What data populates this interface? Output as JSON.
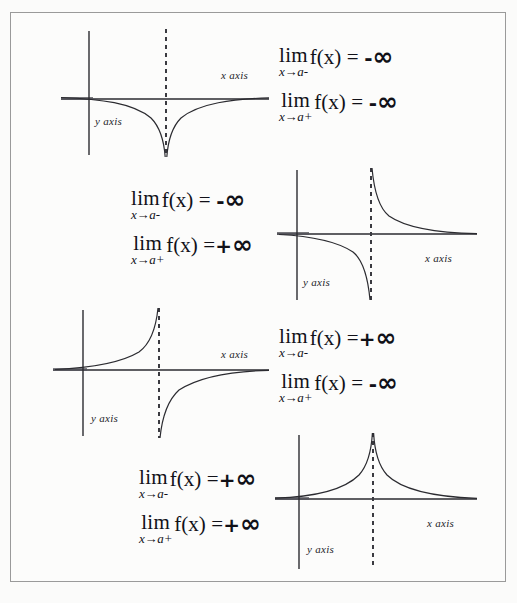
{
  "figure": {
    "border_color": "#9a9a9a",
    "background_color": "#fbfbfa",
    "curve_color": "#2b2b30",
    "axis_color": "#2b2b30",
    "asymptote_color": "#3a3a40",
    "width": 517,
    "height": 603
  },
  "labels": {
    "x_axis": "x axis",
    "y_axis": "y axis",
    "lim": "lim",
    "fx": "f(x)",
    "equals": "=",
    "infinity": "∞",
    "minus": "-",
    "plus": "+",
    "approach_left": "x→a-",
    "approach_right": "x→a+"
  },
  "panels": [
    {
      "id": "panel-1",
      "layout": "graph-left-equations-right",
      "graph": {
        "name": "graph-both-minus-infinity",
        "shape": "downward-spike",
        "left_branch": "-infinity",
        "right_branch": "-infinity",
        "x_axis_label": "x axis",
        "y_axis_label": "y axis"
      },
      "equations": [
        {
          "sub": "x→a-",
          "sign": "-",
          "value": "∞"
        },
        {
          "sub": "x→a+",
          "sign": "-",
          "value": "∞"
        }
      ]
    },
    {
      "id": "panel-2",
      "layout": "equations-left-graph-right",
      "graph": {
        "name": "graph-minus-then-plus-infinity",
        "shape": "down-left-up-right",
        "left_branch": "-infinity",
        "right_branch": "+infinity",
        "x_axis_label": "x axis",
        "y_axis_label": "y axis"
      },
      "equations": [
        {
          "sub": "x→a-",
          "sign": "-",
          "value": "∞"
        },
        {
          "sub": "x→a+",
          "sign": "+",
          "value": "∞"
        }
      ]
    },
    {
      "id": "panel-3",
      "layout": "graph-left-equations-right",
      "graph": {
        "name": "graph-plus-then-minus-infinity",
        "shape": "up-left-down-right",
        "left_branch": "+infinity",
        "right_branch": "-infinity",
        "x_axis_label": "x axis",
        "y_axis_label": "y axis"
      },
      "equations": [
        {
          "sub": "x→a-",
          "sign": "+",
          "value": "∞"
        },
        {
          "sub": "x→a+",
          "sign": "-",
          "value": "∞"
        }
      ]
    },
    {
      "id": "panel-4",
      "layout": "equations-left-graph-right",
      "graph": {
        "name": "graph-both-plus-infinity",
        "shape": "upward-spike",
        "left_branch": "+infinity",
        "right_branch": "+infinity",
        "x_axis_label": "x axis",
        "y_axis_label": "y axis"
      },
      "equations": [
        {
          "sub": "x→a-",
          "sign": "+",
          "value": "∞"
        },
        {
          "sub": "x→a+",
          "sign": "+",
          "value": "∞"
        }
      ]
    }
  ]
}
